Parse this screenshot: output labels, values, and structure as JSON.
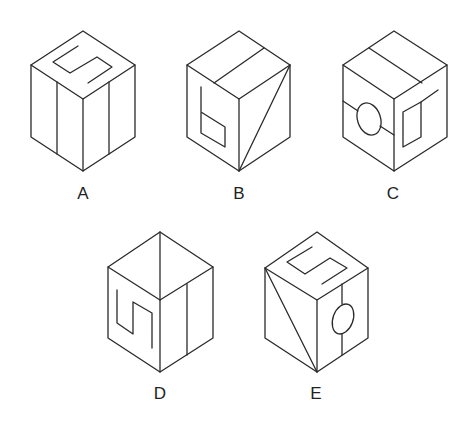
{
  "figure": {
    "type": "cube-options",
    "stroke_color": "#2a2a2a",
    "background": "#ffffff"
  },
  "options": [
    {
      "label": "A",
      "top_face": "S-shaped line",
      "left_face": "vertical line",
      "right_face": "vertical line"
    },
    {
      "label": "B",
      "top_face": "single line",
      "left_face": "b-shaped figure",
      "right_face": "diagonal line"
    },
    {
      "label": "C",
      "top_face": "single line",
      "left_face": "line with circle",
      "right_face": "rectangle with line"
    },
    {
      "label": "D",
      "top_face": "diagonal line",
      "left_face": "S-shaped line",
      "right_face": "vertical line"
    },
    {
      "label": "E",
      "top_face": "S-shaped line",
      "left_face": "diagonal line",
      "right_face": "line with circle"
    }
  ]
}
